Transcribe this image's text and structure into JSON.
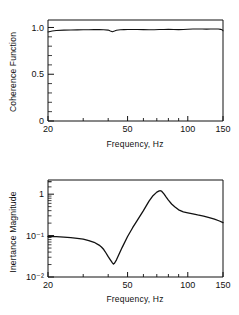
{
  "figure": {
    "background": "#ffffff",
    "ink": "#111111",
    "panels": [
      "coherence",
      "inertance"
    ]
  },
  "chart_data": [
    {
      "type": "line",
      "id": "coherence",
      "title": "",
      "xlabel": "Frequency, Hz",
      "ylabel": "Coherence Function",
      "xscale": "log",
      "yscale": "linear",
      "xlim": [
        20,
        150
      ],
      "ylim": [
        0,
        1.08
      ],
      "grid": false,
      "legend": null,
      "xticks": [
        20,
        50,
        100,
        150
      ],
      "xtick_labels": [
        "20",
        "50",
        "100",
        "150"
      ],
      "xminor_ticks": [
        30,
        40,
        60,
        70,
        80,
        90
      ],
      "yticks": [
        0,
        0.5,
        1.0
      ],
      "ytick_labels": [
        "0",
        "0.5",
        "1.0"
      ],
      "yminor_ticks": [
        0.1,
        0.2,
        0.3,
        0.4,
        0.6,
        0.7,
        0.8,
        0.9
      ],
      "x": [
        20,
        21,
        22,
        24,
        26,
        28,
        30,
        32,
        34,
        36,
        38,
        40,
        41,
        42,
        43,
        44,
        46,
        48,
        50,
        53,
        56,
        60,
        64,
        68,
        72,
        76,
        80,
        85,
        90,
        95,
        100,
        106,
        112,
        118,
        124,
        130,
        136,
        142,
        146,
        149,
        150
      ],
      "y": [
        0.952,
        0.962,
        0.968,
        0.972,
        0.973,
        0.974,
        0.975,
        0.976,
        0.977,
        0.977,
        0.976,
        0.972,
        0.963,
        0.955,
        0.962,
        0.97,
        0.975,
        0.977,
        0.978,
        0.979,
        0.979,
        0.977,
        0.975,
        0.976,
        0.978,
        0.979,
        0.98,
        0.979,
        0.977,
        0.978,
        0.981,
        0.983,
        0.984,
        0.983,
        0.982,
        0.983,
        0.984,
        0.983,
        0.98,
        0.972,
        0.965
      ]
    },
    {
      "type": "line",
      "id": "inertance",
      "title": "",
      "xlabel": "Frequency, Hz",
      "ylabel": "Inertance Magnitude",
      "xscale": "log",
      "yscale": "log",
      "xlim": [
        20,
        150
      ],
      "ylim": [
        0.01,
        2.2
      ],
      "grid": false,
      "legend": null,
      "xticks": [
        20,
        50,
        100,
        150
      ],
      "xtick_labels": [
        "20",
        "50",
        "100",
        "150"
      ],
      "xminor_ticks": [
        30,
        40,
        60,
        70,
        80,
        90
      ],
      "yticks": [
        0.01,
        0.1,
        1
      ],
      "ytick_labels": [
        "10⁻²",
        "10⁻¹",
        "1"
      ],
      "x": [
        20,
        22,
        24,
        26,
        28,
        30,
        32,
        34,
        36,
        37,
        38,
        39,
        40,
        41,
        42,
        42.5,
        43,
        44,
        45,
        47,
        50,
        53,
        56,
        60,
        64,
        67,
        70,
        72,
        73,
        74,
        76,
        78,
        80,
        83,
        86,
        90,
        95,
        100,
        106,
        112,
        120,
        128,
        136,
        144,
        150
      ],
      "y": [
        0.095,
        0.094,
        0.092,
        0.089,
        0.086,
        0.082,
        0.076,
        0.069,
        0.059,
        0.053,
        0.046,
        0.038,
        0.031,
        0.026,
        0.022,
        0.0205,
        0.0215,
        0.026,
        0.033,
        0.052,
        0.095,
        0.155,
        0.235,
        0.4,
        0.68,
        0.92,
        1.12,
        1.2,
        1.21,
        1.18,
        1.02,
        0.85,
        0.72,
        0.58,
        0.5,
        0.42,
        0.375,
        0.355,
        0.335,
        0.315,
        0.295,
        0.272,
        0.25,
        0.225,
        0.205
      ]
    }
  ]
}
